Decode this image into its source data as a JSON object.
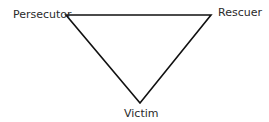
{
  "diagram": {
    "title": "",
    "nodes": [
      {
        "id": "persecutor",
        "label": "Persecutor"
      },
      {
        "id": "rescuer",
        "label": "Rescuer"
      },
      {
        "id": "victim",
        "label": "Victim"
      }
    ],
    "edges": [
      {
        "from": "persecutor",
        "to": "rescuer"
      },
      {
        "from": "rescuer",
        "to": "victim"
      },
      {
        "from": "victim",
        "to": "persecutor"
      }
    ],
    "colors": {
      "line": "#111111",
      "text": "#2a2a2a",
      "background": "#ffffff"
    }
  }
}
